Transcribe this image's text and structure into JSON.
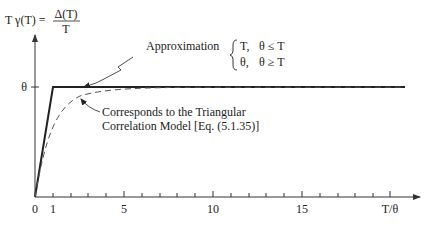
{
  "figure": {
    "y_axis_label": {
      "lhs": "T γ(T) =",
      "numerator": "Δ(T)",
      "denominator": "T"
    },
    "x_axis_label": "T/θ",
    "y_tick_label": "θ",
    "x_tick_labels": [
      "0",
      "1",
      "5",
      "10",
      "15"
    ],
    "annotations": {
      "approximation": "Approximation",
      "piecewise": [
        {
          "value": "T,",
          "condition": "θ ≤ T"
        },
        {
          "value": "θ,",
          "condition": "θ ≥ T"
        }
      ],
      "model_line1": "Corresponds to the Triangular",
      "model_line2": "Correlation Model [Eq. (5.1.35)]"
    },
    "colors": {
      "approximation_line": "#222222",
      "model_curve": "#555555",
      "axes": "#333333"
    }
  }
}
